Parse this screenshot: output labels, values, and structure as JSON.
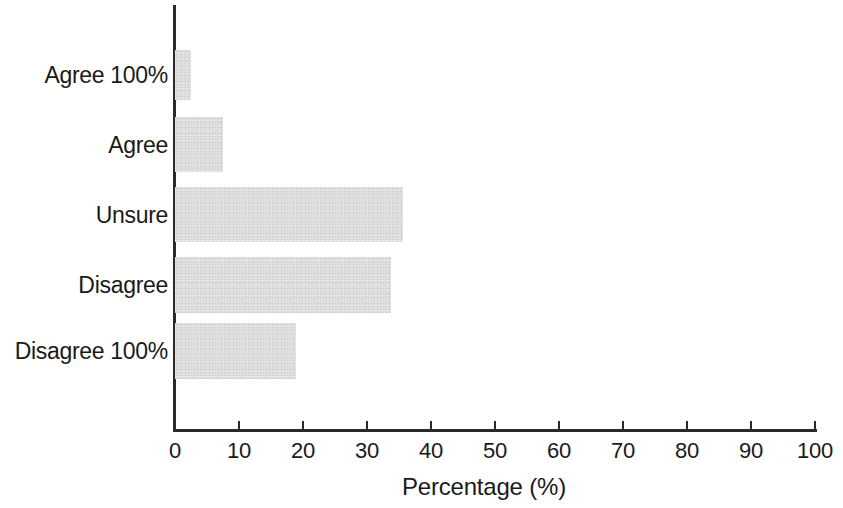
{
  "chart_data": {
    "type": "bar",
    "orientation": "horizontal",
    "title": "",
    "subtitle": "",
    "xlabel": "Percentage (%)",
    "ylabel": "",
    "xlim": [
      0,
      100
    ],
    "xticks": [
      0,
      10,
      20,
      30,
      40,
      50,
      60,
      70,
      80,
      90,
      100
    ],
    "xtick_labels": [
      "0",
      "10",
      "20",
      "30",
      "40",
      "50",
      "60",
      "70",
      "80",
      "90",
      "100"
    ],
    "grid": false,
    "legend": null,
    "bar_color": "#dedede",
    "axis_color": "#2b2b2b",
    "categories": [
      "Agree 100%",
      "Agree",
      "Unsure",
      "Disagree",
      "Disagree 100%"
    ],
    "values": [
      2.5,
      7.5,
      35.7,
      33.7,
      18.9
    ],
    "bars": [
      {
        "label": "Agree 100%",
        "value": 2.5
      },
      {
        "label": "Agree",
        "value": 7.5
      },
      {
        "label": "Unsure",
        "value": 35.7
      },
      {
        "label": "Disagree",
        "value": 33.7
      },
      {
        "label": "Disagree 100%",
        "value": 18.9
      }
    ],
    "annotations": []
  }
}
